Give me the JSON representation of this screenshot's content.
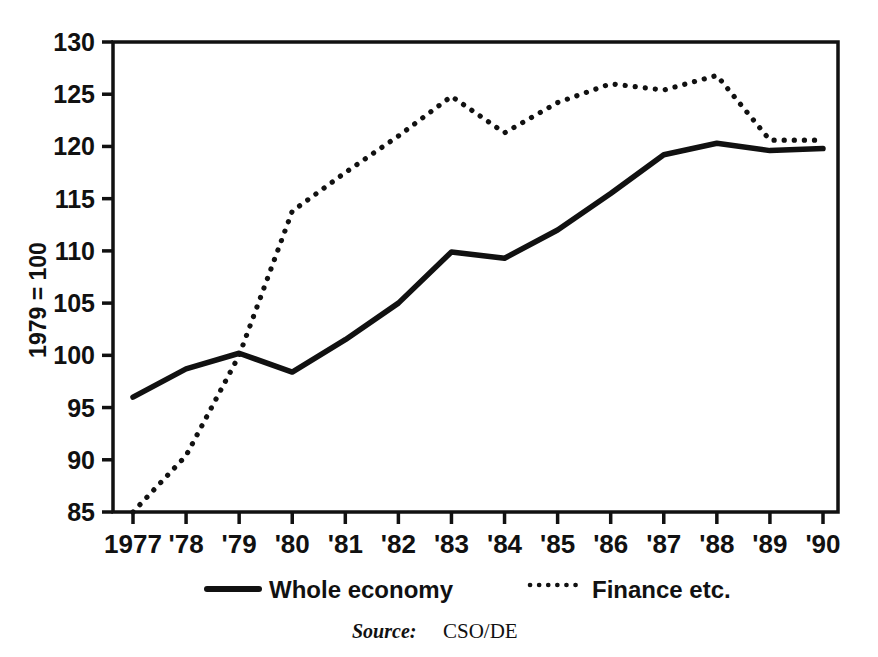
{
  "chart_data": {
    "type": "line",
    "title": "",
    "subtitle": "",
    "xlabel": "",
    "ylabel": "1979 = 100",
    "x": [
      "1977",
      "'78",
      "'79",
      "'80",
      "'81",
      "'82",
      "'83",
      "'84",
      "'85",
      "'86",
      "'87",
      "'88",
      "'89",
      "'90"
    ],
    "categories": [
      "1977",
      "'78",
      "'79",
      "'80",
      "'81",
      "'82",
      "'83",
      "'84",
      "'85",
      "'86",
      "'87",
      "'88",
      "'89",
      "'90"
    ],
    "series": [
      {
        "name": "Whole economy",
        "style": "solid",
        "color": "#111111",
        "values": [
          96.0,
          98.7,
          100.2,
          98.4,
          101.5,
          105.0,
          109.9,
          109.3,
          112.0,
          115.5,
          119.2,
          120.3,
          119.6,
          119.8
        ]
      },
      {
        "name": "Finance etc.",
        "style": "dotted",
        "color": "#111111",
        "values": [
          85.0,
          90.4,
          100.0,
          113.8,
          117.5,
          121.0,
          124.8,
          121.3,
          124.2,
          126.0,
          125.4,
          126.8,
          120.6,
          120.6
        ]
      }
    ],
    "ylim": [
      85,
      130
    ],
    "yticks": [
      85,
      90,
      95,
      100,
      105,
      110,
      115,
      120,
      125,
      130
    ],
    "ytick_labels": [
      "85",
      "90",
      "95",
      "100",
      "105",
      "110",
      "115",
      "120",
      "125",
      "130"
    ],
    "grid": false,
    "legend_position": "bottom",
    "frame": "box"
  },
  "legend": {
    "items": [
      {
        "label": "Whole economy",
        "style": "solid"
      },
      {
        "label": "Finance etc.",
        "style": "dotted"
      }
    ]
  },
  "source": {
    "word": "Source:",
    "value": "CSO/DE"
  }
}
